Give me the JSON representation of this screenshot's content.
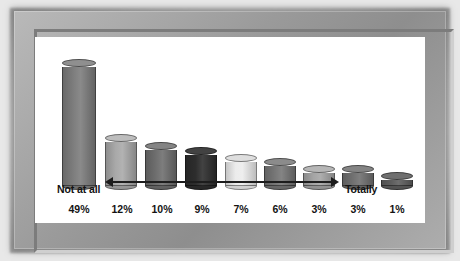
{
  "chart_data": {
    "type": "bar",
    "title": "",
    "subtitle": "",
    "xlabel": "",
    "ylabel": "",
    "categories": [
      "49%",
      "12%",
      "10%",
      "9%",
      "7%",
      "6%",
      "3%",
      "3%",
      "1%"
    ],
    "values": [
      49,
      12,
      10,
      9,
      7,
      6,
      3,
      3,
      1
    ],
    "value_labels": [
      "49%",
      "12%",
      "10%",
      "9%",
      "7%",
      "6%",
      "3%",
      "3%",
      "1%"
    ],
    "ylim": [
      0,
      49
    ],
    "grid": false,
    "legend": "none",
    "style": "3d-cylinder",
    "series": [
      {
        "name": "Response distribution",
        "values": [
          49,
          12,
          10,
          9,
          7,
          6,
          3,
          3,
          1
        ]
      }
    ],
    "bars": [
      {
        "label": "49%",
        "value": 49,
        "color": "#7d7d7d",
        "top_color": "#8f8f8f",
        "shape": "cylinder"
      },
      {
        "label": "12%",
        "value": 12,
        "color": "#a9a9a9",
        "top_color": "#bdbdbd",
        "shape": "cylinder"
      },
      {
        "label": "10%",
        "value": 10,
        "color": "#6e6e6e",
        "top_color": "#848484",
        "shape": "cylinder"
      },
      {
        "label": "9%",
        "value": 9,
        "color": "#2d2d2d",
        "top_color": "#424242",
        "shape": "cylinder"
      },
      {
        "label": "7%",
        "value": 7,
        "color": "#ececec",
        "top_color": "#dedede",
        "shape": "cylinder"
      },
      {
        "label": "6%",
        "value": 6,
        "color": "#767676",
        "top_color": "#8b8b8b",
        "shape": "cylinder"
      },
      {
        "label": "3%",
        "value": 3,
        "color": "#a5a5a5",
        "top_color": "#b6b6b6",
        "shape": "cylinder"
      },
      {
        "label": "3%",
        "value": 3,
        "color": "#707070",
        "top_color": "#848484",
        "shape": "cylinder"
      },
      {
        "label": "1%",
        "value": 1,
        "color": "#5e5e5e",
        "top_color": "#6f6f6f",
        "shape": "cylinder"
      }
    ],
    "annotations": {
      "scale_left_label": "Not at all",
      "scale_right_label": "Totally",
      "arrow": "double-headed-horizontal-arrow",
      "arrow_color": "#1d1d1d"
    }
  },
  "frame": {
    "border_color": "#9a9a9a",
    "canvas_color": "#ffffff",
    "background_color": "#e8e8e8"
  }
}
